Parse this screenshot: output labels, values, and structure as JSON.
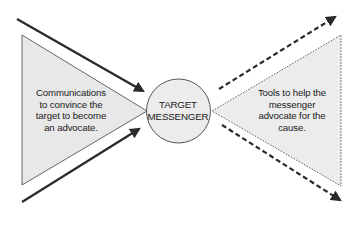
{
  "diagram": {
    "left_triangle": {
      "text": "Communications\nto convince the\ntarget to become\nan advocate.",
      "border_style": "solid",
      "fill": "#e8e8e8"
    },
    "center_circle": {
      "text": "TARGET\nMESSENGER",
      "fill": "#ececec"
    },
    "right_triangle": {
      "text": "Tools to help the\nmessenger\nadvocate for the\ncause.",
      "border_style": "dotted",
      "fill": "#ececec"
    },
    "incoming_arrows": {
      "style": "solid",
      "count": 2,
      "direction": "toward-center"
    },
    "outgoing_arrows": {
      "style": "dashed",
      "count": 2,
      "direction": "away-from-center"
    },
    "colors": {
      "stroke": "#2a2a2a",
      "outline": "#555555",
      "text": "#1a1a1a"
    }
  }
}
